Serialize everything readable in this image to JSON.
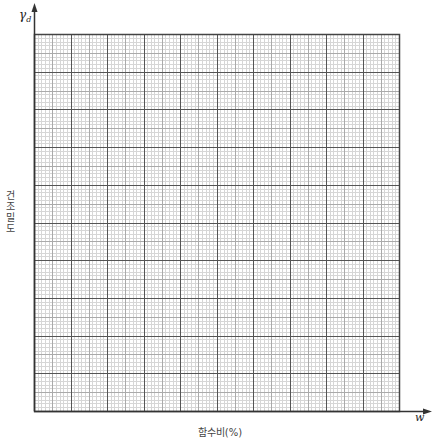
{
  "chart_data": {
    "type": "line",
    "title": "",
    "xlabel": "함수비(%)",
    "ylabel": "건조밀도",
    "x_symbol": "w",
    "y_symbol_base": "γ",
    "y_symbol_sub": "d",
    "series": [],
    "grid": {
      "on": true,
      "major_divisions_x": 10,
      "major_divisions_y": 10,
      "minor_per_major": 10
    },
    "tick_labels_x": [],
    "tick_labels_y": [],
    "note": "Blank graph paper for compaction curve (dry density vs water content); no data plotted"
  },
  "colors": {
    "major_line": "#555555",
    "minor_line": "#d6d6d6",
    "mid_line": "#aaaaaa",
    "axis": "#333333",
    "border": "#444444"
  },
  "layout": {
    "left": 34,
    "top": 34,
    "right": 399,
    "bottom": 411
  }
}
